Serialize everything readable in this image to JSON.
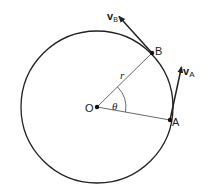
{
  "diagram": {
    "colors": {
      "stroke": "#222222",
      "thin": "#444444",
      "background": "#ffffff"
    },
    "circle": {
      "cx": 97,
      "cy": 107,
      "r": 76
    },
    "points": {
      "O": {
        "label": "O",
        "x": 97,
        "y": 107
      },
      "A": {
        "label": "A",
        "x": 170,
        "y": 120
      },
      "B": {
        "label": "B",
        "x": 152,
        "y": 53
      }
    },
    "vectors": {
      "vA": {
        "symbol": "v",
        "subscript": "A",
        "from": [
          170,
          120
        ],
        "to": [
          182,
          65
        ]
      },
      "vB": {
        "symbol": "v",
        "subscript": "B",
        "from": [
          152,
          53
        ],
        "to": [
          118,
          15
        ]
      }
    },
    "radius_label": "r",
    "angle_label": "θ"
  }
}
